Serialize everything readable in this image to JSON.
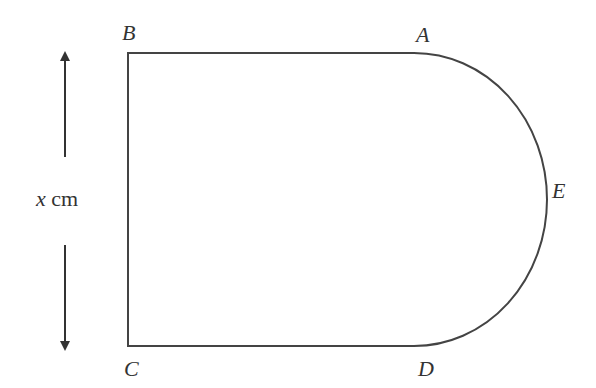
{
  "figure": {
    "type": "composite shape: rectangle with semicircular (elliptical) end",
    "stroke_color": "#444444",
    "background": "#ffffff"
  },
  "labels": {
    "A": "A",
    "B": "B",
    "C": "C",
    "D": "D",
    "E": "E"
  },
  "dimension": {
    "variable": "x",
    "unit": " cm",
    "description": "height BC"
  }
}
